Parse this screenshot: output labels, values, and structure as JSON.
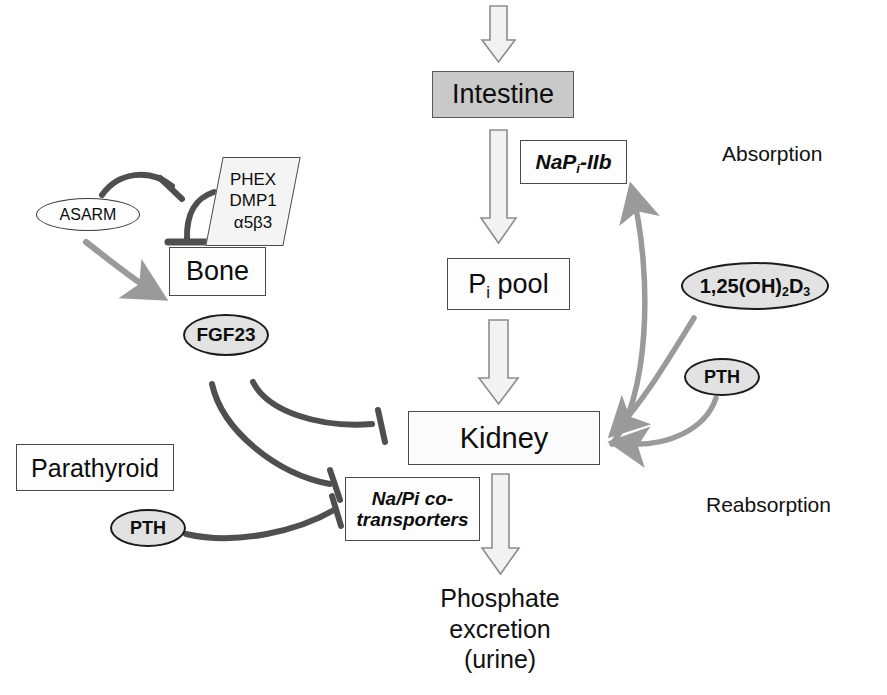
{
  "diagram": {
    "background": "#ffffff",
    "colors": {
      "box_stroke": "#4a4a4a",
      "filled_box": "#c9c9c9",
      "ellipse_fill": "#e2e2e2",
      "dark_connector": "#4f4f4f",
      "gray_connector": "#9a9a9a",
      "block_arrow_fill": "#f2f2f2",
      "block_arrow_stroke": "#8a8a8a",
      "text": "#0d0d0d"
    }
  },
  "nodes": {
    "intestine": {
      "label": "Intestine"
    },
    "napi_iib": {
      "label_pre": "NaP",
      "label_sub": "i",
      "label_post": "-IIb"
    },
    "pi_pool": {
      "label_pre": "P",
      "label_sub": "i",
      "label_post": " pool"
    },
    "kidney": {
      "label": "Kidney"
    },
    "bone": {
      "label": "Bone"
    },
    "parathyroid": {
      "label": "Parathyroid"
    },
    "regulators": {
      "line1": "PHEX",
      "line2": "DMP1",
      "line3": "α5β3"
    },
    "asarm": {
      "label": "ASARM"
    },
    "fgf23": {
      "label": "FGF23"
    },
    "vitd": {
      "label_pre": "1,25(OH)",
      "label_sub1": "2",
      "label_mid": "D",
      "label_sub2": "3"
    },
    "pth_right": {
      "label": "PTH"
    },
    "pth_left": {
      "label": "PTH"
    },
    "na_pi_cotransporters": {
      "line1": "Na/Pi co-",
      "line2": "transporters"
    }
  },
  "captions": {
    "absorption": "Absorption",
    "reabsorption": "Reabsorption",
    "excretion_line1": "Phosphate",
    "excretion_line2": "excretion",
    "excretion_line3": "(urine)"
  },
  "edges": [
    {
      "name": "dietary-intake-to-intestine",
      "style": "block-arrow",
      "from": "dietary intake",
      "to": "intestine"
    },
    {
      "name": "intestine-to-pi-pool",
      "style": "block-arrow",
      "from": "intestine",
      "to": "pi_pool"
    },
    {
      "name": "pi-pool-to-kidney",
      "style": "block-arrow",
      "from": "pi_pool",
      "to": "kidney"
    },
    {
      "name": "kidney-to-phosphate-excretion",
      "style": "block-arrow",
      "from": "kidney",
      "to": "phosphate excretion (urine)"
    },
    {
      "name": "kidney-to-napi-iib",
      "style": "gray-curved-arrow",
      "from": "kidney",
      "to": "napi_iib"
    },
    {
      "name": "vitd-to-kidney",
      "style": "gray-curved-arrow",
      "from": "vitd",
      "to": "kidney"
    },
    {
      "name": "pth-right-to-kidney",
      "style": "gray-curved-arrow",
      "from": "pth_right",
      "to": "kidney"
    },
    {
      "name": "asarm-inhibits-regulators",
      "style": "inhibition",
      "from": "asarm",
      "to": "regulators"
    },
    {
      "name": "regulators-inhibit-bone",
      "style": "inhibition",
      "from": "regulators",
      "to": "bone"
    },
    {
      "name": "asarm-to-bone",
      "style": "gray-arrow",
      "from": "asarm",
      "to": "bone"
    },
    {
      "name": "fgf23-inhibits-kidney",
      "style": "inhibition",
      "from": "fgf23",
      "to": "kidney"
    },
    {
      "name": "fgf23-inhibits-cotransporters",
      "style": "inhibition",
      "from": "fgf23",
      "to": "na_pi_cotransporters"
    },
    {
      "name": "pth-left-inhibits-cotransporters",
      "style": "inhibition",
      "from": "pth_left",
      "to": "na_pi_cotransporters"
    }
  ]
}
